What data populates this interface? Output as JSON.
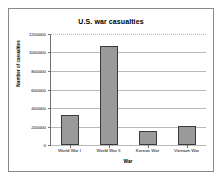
{
  "chart_data": {
    "type": "bar",
    "title": "U.S. war casualties",
    "xlabel": "War",
    "ylabel": "Number of casualties",
    "categories": [
      "World War I",
      "World War II",
      "Korean War",
      "Vietnam War"
    ],
    "values": [
      320000,
      1070000,
      155000,
      210000
    ],
    "ylim": [
      0,
      1200000
    ],
    "ytick_labels": [
      "0",
      "200000",
      "400000",
      "600000",
      "800000",
      "1000000",
      "1200000"
    ],
    "yticks": [
      0,
      200000,
      400000,
      600000,
      800000,
      1000000,
      1200000
    ],
    "grid": true,
    "legend": "none",
    "series": [
      {
        "name": "Number of casualties",
        "values": [
          320000,
          1070000,
          155000,
          210000
        ]
      }
    ]
  },
  "colors": {
    "bar_fill": "#9a9a9a",
    "bar_border": "#3a3a3a",
    "gridline": "#b9b9b9",
    "axis": "#6f6f6f",
    "frame": "#8a8a8a",
    "background": "#ffffff",
    "text": "#000000"
  }
}
